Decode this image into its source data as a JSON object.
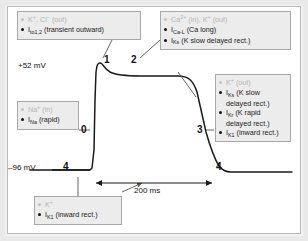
{
  "figure": {
    "axis": {
      "v_max_label": "+52 mV",
      "v_min_label": "–96 mV",
      "time_scale_label": "200 ms"
    },
    "phase_numbers": {
      "p0": "0",
      "p1": "1",
      "p2": "2",
      "p3": "3",
      "p4_left": "4",
      "p4_right": "4"
    },
    "colors": {
      "trace": "#1a1a1a",
      "callout_fill": "#ececec",
      "callout_border": "#a8a8a8",
      "faded_text": "#b4b4b4",
      "frame": "#e9e9e9"
    },
    "callouts": {
      "phase1": {
        "name": "phase-1-callout",
        "lines": [
          {
            "ions": "K",
            "ion_sup": "+",
            "ions2": ", Cl",
            "ion2_sup": "−",
            "tail": " (out)",
            "faded": true
          },
          {
            "current": "I",
            "current_sub": "to1,2",
            "tail": " (transient outward)",
            "faded": false
          }
        ]
      },
      "phase2": {
        "name": "phase-2-callout",
        "lines": [
          {
            "ions": "Ca",
            "ion_sup": "2+",
            "ions2": " (in), K",
            "ion2_sup": "+",
            "tail": " (out)",
            "faded": true
          },
          {
            "current": "I",
            "current_sub": "Ca-L",
            "tail": " (Ca long)",
            "faded": false
          },
          {
            "current": "I",
            "current_sub": "Ks",
            "tail": " (K slow delayed rect.)",
            "faded": false
          }
        ]
      },
      "phase0": {
        "name": "phase-0-callout",
        "lines": [
          {
            "ions": "Na",
            "ion_sup": "+",
            "ions2": "",
            "ion2_sup": "",
            "tail": " (in)",
            "faded": true
          },
          {
            "current": "I",
            "current_sub": "Na",
            "tail": " (rapid)",
            "faded": false
          }
        ]
      },
      "phase3": {
        "name": "phase-3-callout",
        "lines": [
          {
            "ions": "K",
            "ion_sup": "+",
            "ions2": "",
            "ion2_sup": "",
            "tail": " (out)",
            "faded": true
          },
          {
            "current": "I",
            "current_sub": "Ks",
            "tail": " (K slow delayed rect.)",
            "faded": false
          },
          {
            "current": "I",
            "current_sub": "Kr",
            "tail": " (K rapid delayed rect.)",
            "faded": false
          },
          {
            "current": "I",
            "current_sub": "K1",
            "tail": " (inward rect.)",
            "faded": false
          }
        ]
      },
      "phase4": {
        "name": "phase-4-callout",
        "lines": [
          {
            "ions": "K",
            "ion_sup": "+",
            "ions2": "",
            "ion2_sup": "",
            "tail": "",
            "faded": true
          },
          {
            "current": "I",
            "current_sub": "K1",
            "tail": " (inward rect.)",
            "faded": false
          }
        ]
      }
    }
  },
  "chart_data": {
    "type": "line",
    "xlabel": "",
    "ylabel": "Membrane potential (mV)",
    "ylim": [
      -96,
      52
    ],
    "xlim": [
      0,
      330
    ],
    "grid": false,
    "legend": "none",
    "annotations": [
      {
        "text": "+52 mV",
        "kind": "y-axis-tick"
      },
      {
        "text": "–96 mV",
        "kind": "y-axis-tick"
      },
      {
        "text": "200 ms",
        "kind": "x-scale-bar"
      },
      {
        "text": "0",
        "kind": "phase-marker"
      },
      {
        "text": "1",
        "kind": "phase-marker"
      },
      {
        "text": "2",
        "kind": "phase-marker"
      },
      {
        "text": "3",
        "kind": "phase-marker"
      },
      {
        "text": "4",
        "kind": "phase-marker"
      },
      {
        "text": "4",
        "kind": "phase-marker"
      }
    ],
    "series": [
      {
        "name": "membrane potential",
        "x": [
          0,
          20,
          40,
          55,
          60,
          62,
          64,
          70,
          78,
          90,
          110,
          150,
          190,
          210,
          222,
          232,
          244,
          256,
          266,
          274,
          282,
          292,
          310,
          330
        ],
        "y": [
          -96,
          -96,
          -96,
          -96,
          -90,
          -40,
          30,
          48,
          38,
          34,
          33,
          32,
          31,
          28,
          18,
          4,
          -12,
          -30,
          -48,
          -64,
          -78,
          -90,
          -94,
          -94
        ]
      }
    ]
  }
}
